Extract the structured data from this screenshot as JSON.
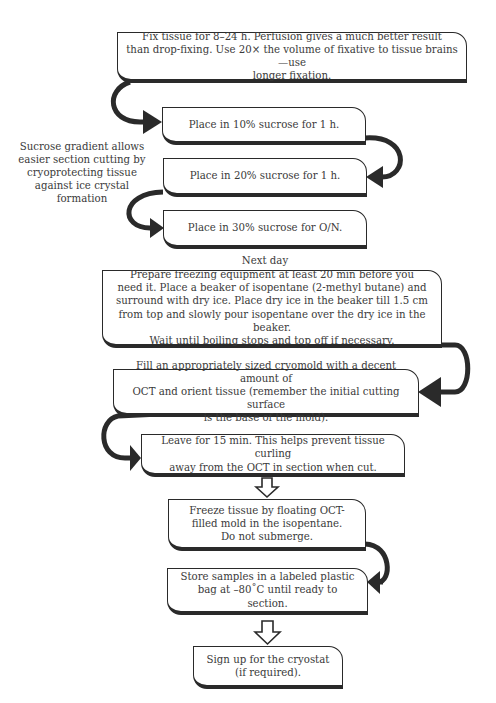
{
  "flowchart": {
    "steps": [
      {
        "id": "fix",
        "text": "Fix tissue for 8–24 h. Perfusion gives a much better result\nthan drop-fixing. Use 20× the volume of fixative to tissue brains—use\nlonger fixation."
      },
      {
        "id": "sucrose-10",
        "text": "Place in 10% sucrose for 1 h."
      },
      {
        "id": "sucrose-20",
        "text": "Place in 20% sucrose for 1 h."
      },
      {
        "id": "sucrose-30",
        "text": "Place in 30% sucrose for O/N."
      },
      {
        "id": "prepare-freezing",
        "text": "Prepare freezing equipment at least 20 min before you\nneed it. Place a beaker of isopentane (2-methyl butane) and\nsurround with dry ice. Place dry ice in the beaker till 1.5 cm\nfrom top and slowly pour isopentane over the dry ice in the beaker.\nWait until boiling stops and top off if necessary."
      },
      {
        "id": "fill-cryomold",
        "text": "Fill an appropriately sized cryomold with a decent amount of\nOCT and orient tissue (remember the initial cutting surface\nis the base of the mold)."
      },
      {
        "id": "leave-15",
        "text": "Leave for 15 min. This helps prevent tissue curling\naway from the OCT in section when cut."
      },
      {
        "id": "freeze",
        "text": "Freeze tissue by floating OCT-\nfilled mold in the isopentane.\nDo not submerge."
      },
      {
        "id": "store",
        "text": "Store samples in a labeled plastic\nbag at –80˚C until ready to section."
      },
      {
        "id": "sign-up",
        "text": "Sign up for the cryostat\n(if required)."
      }
    ],
    "annotations": {
      "sucrose_note": "Sucrose gradient allows\neasier section cutting by\ncryoprotecting tissue\nagainst ice crystal\nformation",
      "next_day": "Next day"
    },
    "colors": {
      "stroke": "#2a2a2a",
      "text": "#3a3a3a",
      "background": "#ffffff"
    }
  }
}
